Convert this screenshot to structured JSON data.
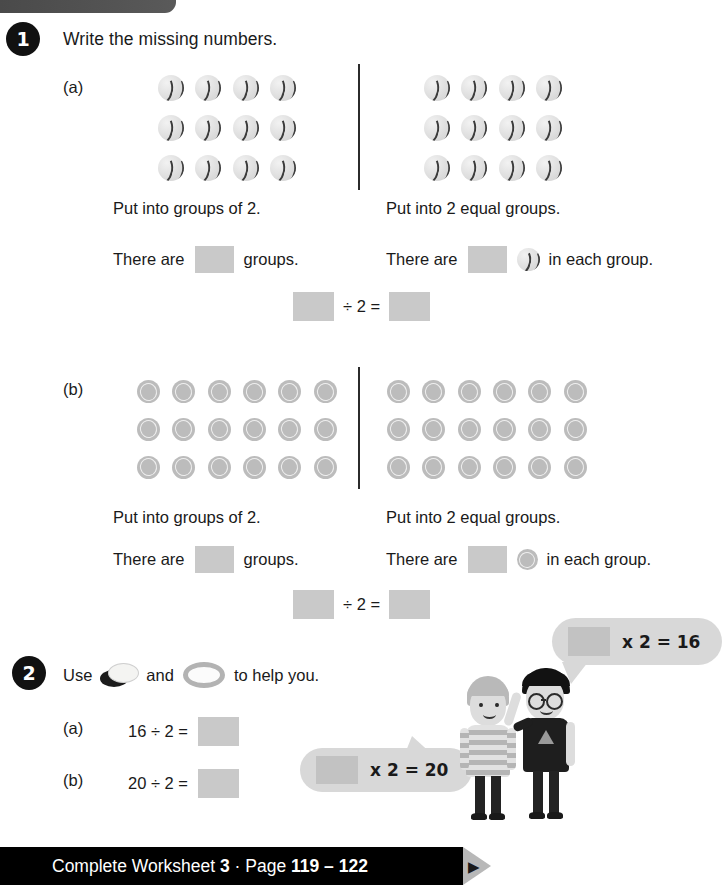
{
  "page": {
    "width": 710,
    "height": 893,
    "background": "#ffffff",
    "accent_dark": "#111111",
    "answer_box_color": "#c9c9c9",
    "bubble_color": "#d8d8d8"
  },
  "top_bar": {
    "name": "decorative-top-bar",
    "color": "#4a4a4a"
  },
  "questions": [
    {
      "number": "1",
      "prompt": "Write the missing numbers.",
      "parts": [
        {
          "label": "(a)",
          "object": "baseball",
          "left_group": {
            "columns": 4,
            "rows": 3,
            "count": 12
          },
          "right_group": {
            "columns": 4,
            "rows": 3,
            "count": 12
          },
          "left_instruction": "Put into groups of 2.",
          "right_instruction": "Put into 2 equal groups.",
          "left_sentence_prefix": "There are",
          "left_sentence_suffix": "groups.",
          "right_sentence_prefix": "There are",
          "right_sentence_suffix": "in each group.",
          "equation": {
            "operator": "÷ 2 ="
          }
        },
        {
          "label": "(b)",
          "object": "coin",
          "left_group": {
            "columns": 6,
            "rows": 3,
            "count": 18
          },
          "right_group": {
            "columns": 6,
            "rows": 3,
            "count": 18
          },
          "left_instruction": "Put into groups of 2.",
          "right_instruction": "Put into 2 equal groups.",
          "left_sentence_prefix": "There are",
          "left_sentence_suffix": "groups.",
          "right_sentence_prefix": "There are",
          "right_sentence_suffix": "in each group.",
          "equation": {
            "operator": "÷ 2 ="
          }
        }
      ]
    },
    {
      "number": "2",
      "prompt_start": "Use",
      "prompt_middle": "and",
      "prompt_end": "to help you.",
      "items": [
        {
          "label": "(a)",
          "expression": "16 ÷ 2 ="
        },
        {
          "label": "(b)",
          "expression": "20 ÷ 2 ="
        }
      ]
    }
  ],
  "speech_bubbles": [
    {
      "name": "bubble-top",
      "text": "x 2 = 16"
    },
    {
      "name": "bubble-bottom",
      "text": "x 2 = 20"
    }
  ],
  "characters": [
    {
      "name": "child-striped-shirt"
    },
    {
      "name": "child-with-glasses"
    }
  ],
  "footer": {
    "text_part_1": "Complete Worksheet ",
    "worksheet_number": "3",
    "separator": " · Page ",
    "pages": "119 – 122",
    "arrow": "▶"
  }
}
